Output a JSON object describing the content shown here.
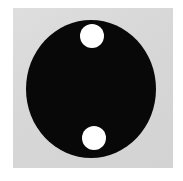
{
  "image": {
    "title": "Dark disc with two circular holes",
    "width": 183,
    "height": 181,
    "background_color": "#ffffff"
  },
  "plate": {
    "name": "image-plate",
    "fill_color": "#d9d9d9",
    "x": 13,
    "y": 8,
    "width": 160,
    "height": 160
  },
  "shapes": {
    "disc": {
      "label": "dark-disc",
      "fill_color": "#080808",
      "center_x": 91,
      "center_y": 89,
      "radius_x": 65,
      "radius_y": 69
    },
    "holes": [
      {
        "label": "upper-hole",
        "fill_color": "#ffffff",
        "center_x": 92,
        "center_y": 36,
        "radius": 12
      },
      {
        "label": "lower-hole",
        "fill_color": "#ffffff",
        "center_x": 94,
        "center_y": 138,
        "radius": 12
      }
    ]
  }
}
